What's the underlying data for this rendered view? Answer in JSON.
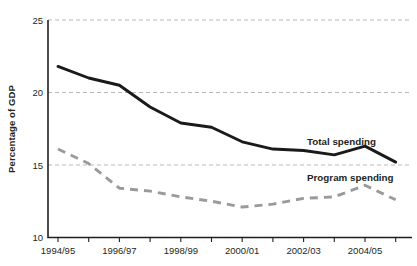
{
  "chart_data": {
    "type": "line",
    "title": "",
    "subtitle": "",
    "xlabel": "",
    "ylabel": "Percentage of GDP",
    "ylim": [
      10,
      25
    ],
    "yticks": [
      10,
      15,
      20,
      25
    ],
    "ytick_labels": [
      "10",
      "15",
      "20",
      "25"
    ],
    "grid": "horizontal dashed at 15, 20, 25",
    "legend_position": "inline right, labels beside series ends",
    "x": [
      "1994/95",
      "1995/96",
      "1996/97",
      "1997/98",
      "1998/99",
      "1999/2000",
      "2000/01",
      "2001/02",
      "2002/03",
      "2003/04",
      "2004/05",
      "2005/06"
    ],
    "xtick_labels_shown": [
      "1994/95",
      "1996/97",
      "1998/99",
      "2000/01",
      "2002/03",
      "2004/05"
    ],
    "series": [
      {
        "name": "Total spending",
        "style": "solid-black",
        "color": "#1a1a1a",
        "values": [
          21.8,
          21.0,
          20.5,
          19.0,
          17.9,
          17.6,
          16.6,
          16.1,
          16.0,
          15.7,
          16.3,
          15.2
        ]
      },
      {
        "name": "Program spending",
        "style": "dashed-grey",
        "color": "#9a9a9a",
        "values": [
          16.1,
          15.1,
          13.4,
          13.2,
          12.8,
          12.5,
          12.1,
          12.3,
          12.7,
          12.8,
          13.6,
          12.6
        ]
      }
    ],
    "annotations": [
      {
        "text": "Total spending",
        "attached_to": "Total spending"
      },
      {
        "text": "Program spending",
        "attached_to": "Program spending"
      }
    ]
  }
}
